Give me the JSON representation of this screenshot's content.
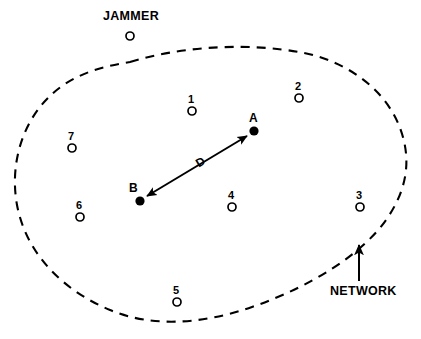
{
  "diagram": {
    "colors": {
      "ink": "#000000",
      "background": "#ffffff"
    },
    "boundary": {
      "name": "network-boundary",
      "style": "dashed",
      "label": "NETWORK"
    },
    "callouts": [
      {
        "id": "jammer",
        "label": "JAMMER",
        "label_x": 103,
        "label_y": 10,
        "marker": {
          "type": "open-circle",
          "x": 130,
          "y": 36,
          "r": 4
        }
      },
      {
        "id": "network",
        "label": "NETWORK",
        "label_x": 330,
        "label_y": 285,
        "arrow": {
          "x1": 359,
          "y1": 281,
          "x2": 359,
          "y2": 245
        }
      }
    ],
    "nodes": [
      {
        "id": "1",
        "label": "1",
        "x": 192,
        "y": 111,
        "r": 4,
        "fill": "open",
        "label_x": 188,
        "label_y": 94
      },
      {
        "id": "2",
        "label": "2",
        "x": 299,
        "y": 98,
        "r": 4,
        "fill": "open",
        "label_x": 295,
        "label_y": 81
      },
      {
        "id": "3",
        "label": "3",
        "x": 360,
        "y": 207,
        "r": 4,
        "fill": "open",
        "label_x": 356,
        "label_y": 190
      },
      {
        "id": "4",
        "label": "4",
        "x": 232,
        "y": 207,
        "r": 4,
        "fill": "open",
        "label_x": 228,
        "label_y": 190
      },
      {
        "id": "5",
        "label": "5",
        "x": 177,
        "y": 302,
        "r": 4,
        "fill": "open",
        "label_x": 173,
        "label_y": 285
      },
      {
        "id": "6",
        "label": "6",
        "x": 80,
        "y": 217,
        "r": 4,
        "fill": "open",
        "label_x": 76,
        "label_y": 200
      },
      {
        "id": "7",
        "label": "7",
        "x": 72,
        "y": 148,
        "r": 4,
        "fill": "open",
        "label_x": 68,
        "label_y": 131
      }
    ],
    "endpoints": [
      {
        "id": "A",
        "label": "A",
        "x": 254,
        "y": 131,
        "r": 4.6,
        "fill": "solid",
        "label_x": 249,
        "label_y": 112
      },
      {
        "id": "B",
        "label": "B",
        "x": 140,
        "y": 201,
        "r": 4.6,
        "fill": "solid",
        "label_x": 129,
        "label_y": 182
      }
    ],
    "link": {
      "id": "distance-link",
      "label": "D",
      "from": "B",
      "to": "A",
      "arrowheads": "both",
      "label_x": 200,
      "label_y": 163,
      "label_rotation": -31
    }
  }
}
